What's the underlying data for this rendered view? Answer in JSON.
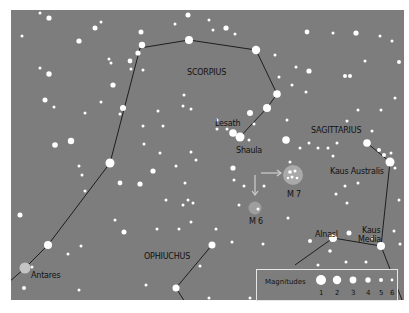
{
  "map": {
    "background": "#7d7d7d",
    "line_color": "#1e1e1e",
    "star_color": "#ffffff",
    "constellations": [
      {
        "name": "SCORPIUS",
        "x": 187,
        "y": 68
      },
      {
        "name": "SAGITTARIUS",
        "x": 311,
        "y": 126
      },
      {
        "name": "OPHIUCHUS",
        "x": 144,
        "y": 252
      }
    ],
    "named_stars": [
      {
        "name": "Lesath",
        "x": 215,
        "y": 119
      },
      {
        "name": "Shaula",
        "x": 236,
        "y": 146
      },
      {
        "name": "Antares",
        "x": 31,
        "y": 271
      },
      {
        "name": "Kaus Australis",
        "x": 330,
        "y": 167
      },
      {
        "name": "Alnasl",
        "x": 315,
        "y": 230
      },
      {
        "name": "Kaus",
        "x": 362,
        "y": 226
      },
      {
        "name": "Media",
        "x": 358,
        "y": 235
      }
    ],
    "clusters": [
      {
        "name": "M 7",
        "x": 287,
        "y": 190
      },
      {
        "name": "M 6",
        "x": 249,
        "y": 217
      }
    ]
  },
  "legend": {
    "title": "Magnitudes",
    "magnitudes": [
      "1",
      "2",
      "3",
      "4",
      "5",
      "6"
    ]
  }
}
